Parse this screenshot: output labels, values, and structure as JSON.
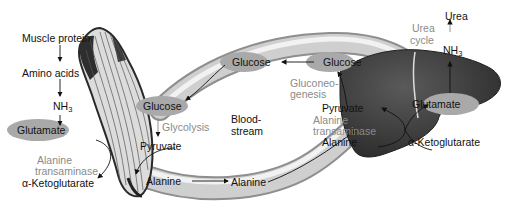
{
  "diagram": {
    "muscle": {
      "muscle_protein": "Muscle protein",
      "amino_acids": "Amino acids",
      "nh3": "NH",
      "nh3_sub": "3",
      "glutamate": "Glutamate",
      "enzyme_line1": "Alanine",
      "enzyme_line2": "transaminase",
      "a_ketoglutarate": "α-Ketoglutarate",
      "glucose": "Glucose",
      "glycolysis": "Glycolysis",
      "pyruvate": "Pyruvate",
      "alanine": "Alanine"
    },
    "bloodstream": {
      "line1": "Blood-",
      "line2": "stream",
      "glucose": "Glucose",
      "alanine": "Alanine"
    },
    "liver": {
      "glucose": "Glucose",
      "gluconeogenesis_line1": "Gluconeo-",
      "gluconeogenesis_line2": "genesis",
      "pyruvate": "Pyruvate",
      "enzyme_line1": "Alanine",
      "enzyme_line2": "transaminase",
      "alanine": "Alanine",
      "glutamate": "Glutamate",
      "a_ketoglutarate": "α-Ketoglutarate",
      "urea_cycle_line1": "Urea",
      "urea_cycle_line2": "cycle",
      "nh3": "NH",
      "nh3_sub": "3",
      "urea": "Urea"
    },
    "colors": {
      "vessel": "#c8c8c8",
      "vessel_highlight": "#ececec",
      "vessel_edge": "#9a9a9a",
      "oval": "#a9a9a9",
      "liver": "#3a3a3a",
      "liver_light": "#555555",
      "muscle": "#d9d9d9",
      "muscle_dark": "#2a2a2a",
      "label_gray": "#8a8a8a"
    }
  }
}
